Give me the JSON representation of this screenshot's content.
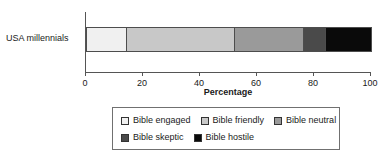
{
  "chart_data": {
    "type": "bar",
    "orientation": "horizontal",
    "stacked": true,
    "title": "",
    "xlabel": "Percentage",
    "ylabel": "",
    "categories": [
      "USA millennials"
    ],
    "xlim": [
      0,
      100
    ],
    "xticks": [
      0,
      20,
      40,
      60,
      80,
      100
    ],
    "xtick_labels": [
      "0",
      "20",
      "40",
      "60",
      "80",
      "100"
    ],
    "grid": false,
    "legend_position": "bottom",
    "series": [
      {
        "name": "Bible engaged",
        "values": [
          14
        ],
        "color": "#f0f0f0"
      },
      {
        "name": "Bible friendly",
        "values": [
          38
        ],
        "color": "#c8c8c8"
      },
      {
        "name": "Bible neutral",
        "values": [
          24
        ],
        "color": "#9a9a9a"
      },
      {
        "name": "Bible skeptic",
        "values": [
          8
        ],
        "color": "#4a4a4a"
      },
      {
        "name": "Bible hostile",
        "values": [
          16
        ],
        "color": "#0a0a0a"
      }
    ],
    "cumulative_boundaries": [
      14,
      52,
      76,
      84,
      100
    ]
  },
  "legend": {
    "rows": [
      [
        {
          "label": "Bible engaged",
          "color": "#f0f0f0"
        },
        {
          "label": "Bible friendly",
          "color": "#c8c8c8"
        },
        {
          "label": "Bible neutral",
          "color": "#9a9a9a"
        }
      ],
      [
        {
          "label": "Bible skeptic",
          "color": "#4a4a4a"
        },
        {
          "label": "Bible hostile",
          "color": "#0a0a0a"
        }
      ]
    ]
  }
}
